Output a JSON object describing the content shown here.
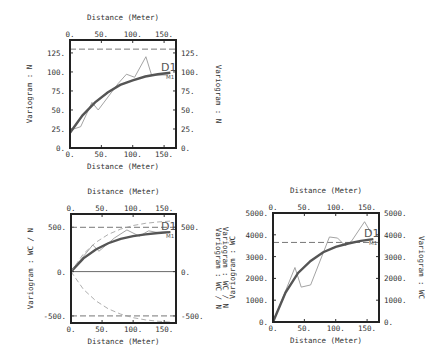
{
  "chart_data": [
    {
      "type": "line",
      "panel": "top-left",
      "title_top": "Distance (Meter)",
      "xlabel": "Distance (Meter)",
      "ylabel": "Variogram : N",
      "ylabel_right": "Variogram : N",
      "xlim": [
        0,
        169
      ],
      "ylim": [
        0,
        142
      ],
      "x_ticks": [
        "0.",
        "50.",
        "100.",
        "150."
      ],
      "y_ticks": [
        "0.",
        "25.",
        "50.",
        "75.",
        "100.",
        "125."
      ],
      "sill_dashed": 130,
      "labels": {
        "experimental": "D1",
        "model": "M1"
      },
      "series": [
        {
          "name": "D1 (experimental)",
          "x": [
            2,
            17,
            35,
            45,
            77,
            90,
            103,
            121,
            130,
            156
          ],
          "y": [
            24,
            28,
            60,
            50,
            85,
            97,
            93,
            120,
            96,
            96
          ]
        },
        {
          "name": "M1 (model)",
          "x": [
            0,
            20,
            40,
            60,
            80,
            100,
            120,
            140,
            160
          ],
          "y": [
            20,
            43,
            60,
            73,
            83,
            89,
            94,
            97,
            99
          ]
        }
      ]
    },
    {
      "type": "line",
      "panel": "bottom-left",
      "title_top": "Distance (Meter)",
      "xlabel": "Distance (Meter)",
      "ylabel": "Variogram : WC / N",
      "ylabel_right": "Variogram : WC / N",
      "xlim": [
        0,
        169
      ],
      "ylim": [
        -580,
        650
      ],
      "x_ticks": [
        "0.",
        "50.",
        "100.",
        "150."
      ],
      "y_ticks": [
        "-500.",
        "0.",
        "500."
      ],
      "sill_dashed": 500,
      "labels": {
        "experimental": "D1",
        "model": "M1"
      },
      "series": [
        {
          "name": "D1 (experimental)",
          "x": [
            0,
            35,
            45,
            70,
            90,
            110,
            125,
            140,
            156
          ],
          "y": [
            0,
            300,
            230,
            380,
            470,
            400,
            460,
            440,
            450
          ]
        },
        {
          "name": "M1 (model)",
          "x": [
            0,
            20,
            40,
            60,
            80,
            100,
            120,
            140,
            160
          ],
          "y": [
            0,
            150,
            250,
            320,
            370,
            400,
            420,
            435,
            445
          ]
        },
        {
          "name": "upper envelope",
          "x": [
            0,
            20,
            40,
            60,
            80,
            100,
            120,
            140,
            160
          ],
          "y": [
            0,
            200,
            330,
            420,
            480,
            520,
            545,
            560,
            570
          ]
        },
        {
          "name": "lower envelope",
          "x": [
            0,
            20,
            40,
            60,
            80,
            100,
            120,
            140,
            160
          ],
          "y": [
            0,
            -200,
            -330,
            -420,
            -480,
            -520,
            -545,
            -560,
            -570
          ]
        }
      ]
    },
    {
      "type": "line",
      "panel": "bottom-right",
      "title_top": "Distance (Meter)",
      "xlabel": "Distance (Meter)",
      "ylabel": "Variogram : WC",
      "ylabel_overlap": "Variogram : WC / N",
      "ylabel_right": "Variogram : WC",
      "xlim": [
        0,
        169
      ],
      "ylim": [
        0,
        5000
      ],
      "x_ticks": [
        "0.",
        "50.",
        "100.",
        "150."
      ],
      "y_ticks": [
        "0.",
        "1000.",
        "2000.",
        "3000.",
        "4000.",
        "5000."
      ],
      "sill_dashed": 3650,
      "labels": {
        "experimental": "D1",
        "model": "M1"
      },
      "series": [
        {
          "name": "D1 (experimental)",
          "x": [
            0,
            35,
            45,
            60,
            90,
            103,
            115,
            125,
            146,
            156
          ],
          "y": [
            0,
            2500,
            1600,
            1700,
            3900,
            3850,
            3500,
            3700,
            4600,
            4100
          ]
        },
        {
          "name": "M1 (model)",
          "x": [
            0,
            20,
            40,
            60,
            80,
            100,
            120,
            140,
            160
          ],
          "y": [
            0,
            1350,
            2250,
            2800,
            3200,
            3450,
            3600,
            3720,
            3800
          ]
        }
      ]
    }
  ]
}
